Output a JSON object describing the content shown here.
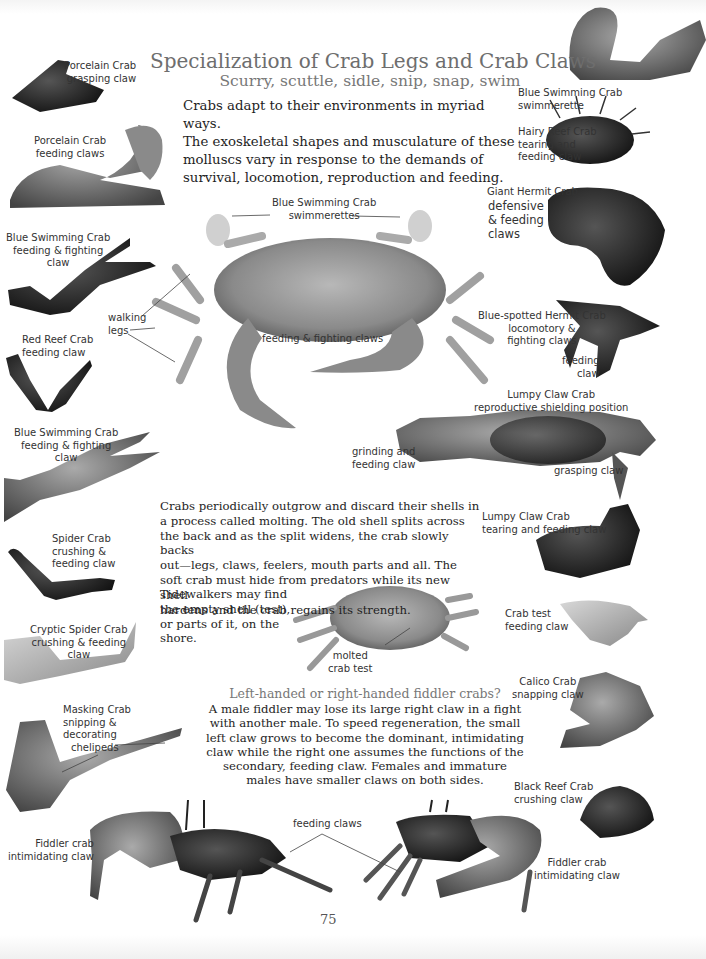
{
  "page": {
    "title": "Specialization of Crab Legs and Crab Claws",
    "subtitle": "Scurry, scuttle, sidle, snip, snap, swim",
    "intro": [
      "Crabs adapt to their environments in myriad ways.",
      "The exoskeletal shapes and musculature of these",
      "molluscs vary in response to the demands of",
      "survival, locomotion, reproduction and feeding."
    ],
    "molting": [
      "Crabs periodically outgrow and discard their shells in",
      "a process called molting. The old shell splits across",
      "the back and as the split widens, the crab slowly backs",
      "out—legs, claws, feelers, mouth parts and all. The",
      "soft crab must hide from predators while its new shell",
      "hardens and the crab regains its strength."
    ],
    "molting_tail": [
      "Tidewalkers may find",
      "the empty shell (test),",
      "or parts of it, on the",
      "shore."
    ],
    "fiddler_heading": "Left-handed or right-handed fiddler crabs?",
    "fiddler_text": [
      "A male fiddler may lose its large right claw in a fight",
      "with another male. To speed regeneration, the small",
      "left claw grows to become the dominant, intimidating",
      "claw while the right one assumes the functions of the",
      "secondary, feeding claw. Females and immature",
      "males have smaller claws on both sides."
    ],
    "page_number": "75"
  },
  "labels": {
    "porcelain_grasping": [
      "Porcelain Crab",
      "grasping claw"
    ],
    "porcelain_feeding": [
      "Porcelain Crab",
      "feeding claws"
    ],
    "blue_swim_feeding_1": [
      "Blue Swimming Crab",
      "feeding & fighting",
      "claw"
    ],
    "red_reef": [
      "Red Reef Crab",
      "feeding claw"
    ],
    "blue_swim_feeding_2": [
      "Blue Swimming Crab",
      "feeding & fighting",
      "claw"
    ],
    "spider_crab": [
      "Spider Crab",
      "crushing &",
      "feeding claw"
    ],
    "cryptic_spider": [
      "Cryptic Spider Crab",
      "crushing & feeding",
      "claw"
    ],
    "masking_crab": [
      "Masking Crab",
      "snipping &",
      "decorating",
      "chelipeds"
    ],
    "fiddler_left": [
      "Fiddler crab",
      "intimidating claw"
    ],
    "blue_swimmerette": [
      "Blue Swimming Crab",
      "swimmerette"
    ],
    "hairy_reef": [
      "Hairy Reef Crab",
      "tearing and",
      "feeding claw"
    ],
    "giant_hermit_name": "Giant Hermit Crab",
    "giant_hermit_desc": [
      "defensive",
      "&  feeding",
      "claws"
    ],
    "blue_spotted_hermit": [
      "Blue-spotted Hermit Crab",
      "locomotory &",
      "fighting claws"
    ],
    "blue_spotted_feeding": [
      "feeding",
      "claw"
    ],
    "lumpy_shielding": [
      "Lumpy Claw Crab",
      "reproductive shielding position"
    ],
    "grinding": [
      "grinding and",
      "feeding claw"
    ],
    "grasping": "grasping claw",
    "lumpy_tearing": [
      "Lumpy Claw Crab",
      "tearing and feeding claw"
    ],
    "crab_test_claw": [
      "Crab test",
      "feeding claw"
    ],
    "calico": [
      "Calico Crab",
      "snapping claw"
    ],
    "black_reef": [
      "Black Reef Crab",
      "crushing claw"
    ],
    "fiddler_right": [
      "Fiddler crab",
      "intimidating claw"
    ],
    "center_swimmerettes": [
      "Blue Swimming Crab",
      "swimmerettes"
    ],
    "walking_legs": [
      "walking",
      "legs"
    ],
    "center_feeding_fighting": "feeding & fighting claws",
    "molted_test": [
      "molted",
      "crab test"
    ],
    "feeding_claws": "feeding claws"
  }
}
